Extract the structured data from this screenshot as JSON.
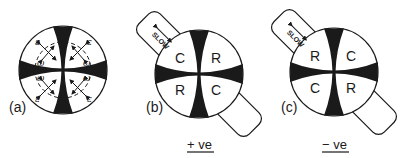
{
  "figure": {
    "panels": [
      {
        "id": "a",
        "label": "(a)",
        "cross": "isogyre",
        "annotations": {
          "epsilon": "ε",
          "omega": "ω"
        },
        "quadrants": []
      },
      {
        "id": "b",
        "label": "(b)",
        "plate_label": "SLOW",
        "quadrants": {
          "top_left": "C",
          "top_right": "R",
          "bottom_left": "R",
          "bottom_right": "C"
        },
        "sign_caption": "+ ve"
      },
      {
        "id": "c",
        "label": "(c)",
        "plate_label": "SLOW",
        "quadrants": {
          "top_left": "R",
          "top_right": "C",
          "bottom_left": "C",
          "bottom_right": "R"
        },
        "sign_caption": "− ve"
      }
    ],
    "colors": {
      "ink": "#1a1a1a",
      "background": "#ffffff"
    }
  }
}
